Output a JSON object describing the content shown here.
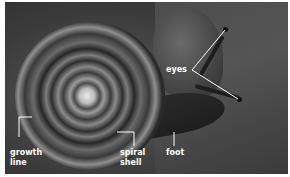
{
  "image": {
    "subject": "snail",
    "style": "grayscale photograph with white labels"
  },
  "labels": {
    "eyes": "eyes",
    "growth_line": [
      "growth",
      "line"
    ],
    "spiral_shell": [
      "spiral",
      "shell"
    ],
    "foot": "foot"
  },
  "colors": {
    "label_text": "#ffffff",
    "border": "#ffffff"
  }
}
